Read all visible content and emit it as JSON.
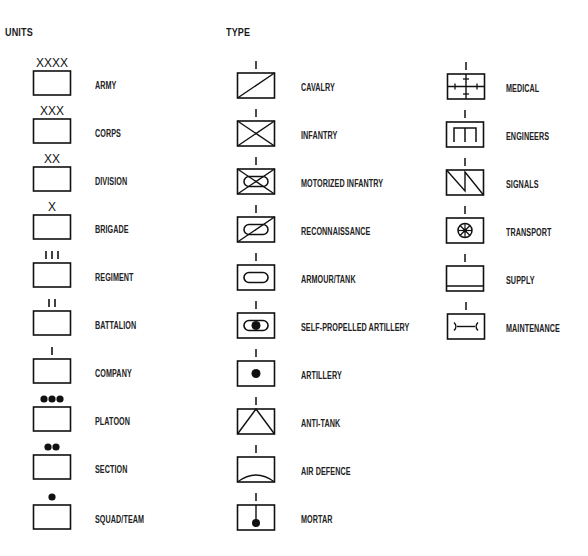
{
  "headings": {
    "units": "UNITS",
    "type": "TYPE"
  },
  "units": [
    {
      "label": "ARMY",
      "echelon": "XXXX",
      "marker": "text"
    },
    {
      "label": "CORPS",
      "echelon": "XXX",
      "marker": "text"
    },
    {
      "label": "DIVISION",
      "echelon": "XX",
      "marker": "text"
    },
    {
      "label": "BRIGADE",
      "echelon": "X",
      "marker": "text"
    },
    {
      "label": "REGIMENT",
      "echelon": "III",
      "marker": "bars"
    },
    {
      "label": "BATTALION",
      "echelon": "II",
      "marker": "bars"
    },
    {
      "label": "COMPANY",
      "echelon": "I",
      "marker": "bars"
    },
    {
      "label": "PLATOON",
      "echelon": "●●●",
      "marker": "dots"
    },
    {
      "label": "SECTION",
      "echelon": "●●",
      "marker": "dots"
    },
    {
      "label": "SQUAD/TEAM",
      "echelon": "●",
      "marker": "dots"
    }
  ],
  "types_col1": [
    {
      "label": "CAVALRY",
      "icon": "diagonal-slash"
    },
    {
      "label": "INFANTRY",
      "icon": "x-cross"
    },
    {
      "label": "MOTORIZED INFANTRY",
      "icon": "x-cross-oval"
    },
    {
      "label": "RECONNAISSANCE",
      "icon": "slash-oval"
    },
    {
      "label": "ARMOUR/TANK",
      "icon": "oval"
    },
    {
      "label": "SELF-PROPELLED ARTILLERY",
      "icon": "oval-dot"
    },
    {
      "label": "ARTILLERY",
      "icon": "dot"
    },
    {
      "label": "ANTI-TANK",
      "icon": "inverted-v"
    },
    {
      "label": "AIR DEFENCE",
      "icon": "arc"
    },
    {
      "label": "MORTAR",
      "icon": "stem-dot"
    }
  ],
  "types_col2": [
    {
      "label": "MEDICAL",
      "icon": "cross-ticks"
    },
    {
      "label": "ENGINEERS",
      "icon": "bridge"
    },
    {
      "label": "SIGNALS",
      "icon": "lightning-zigzag"
    },
    {
      "label": "TRANSPORT",
      "icon": "wheel"
    },
    {
      "label": "SUPPLY",
      "icon": "bottom-bar"
    },
    {
      "label": "MAINTENANCE",
      "icon": "wrench"
    }
  ],
  "type_echelon_marker": "I"
}
